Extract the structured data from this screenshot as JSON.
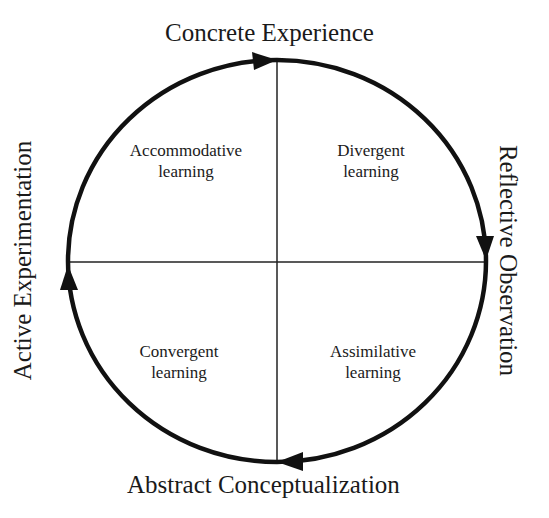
{
  "diagram": {
    "poles": {
      "top": "Concrete Experience",
      "right": "Reflective Observation",
      "bottom": "Abstract Conceptualization",
      "left": "Active Experimentation"
    },
    "quadrants": {
      "top_left": {
        "line1": "Accommodative",
        "line2": "learning"
      },
      "top_right": {
        "line1": "Divergent",
        "line2": "learning"
      },
      "bottom_left": {
        "line1": "Convergent",
        "line2": "learning"
      },
      "bottom_right": {
        "line1": "Assimilative",
        "line2": "learning"
      }
    },
    "cycle_direction": "clockwise",
    "colors": {
      "stroke": "#111111",
      "text": "#1a1a1a",
      "background": "#ffffff"
    }
  }
}
